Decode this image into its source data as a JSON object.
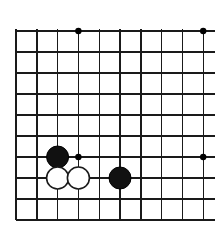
{
  "figure": {
    "board_kind": "go-board",
    "background_color": "#ffffff",
    "line_color": "#1a1a1a",
    "star_point_color": "#000000"
  },
  "board": {
    "columns": 10,
    "rows": 10,
    "origin_x": 16,
    "origin_y": 31,
    "spacing_x": 20.8,
    "spacing_y": 21.0,
    "edge_overhang_right": 12,
    "line_width_thin": 1.4,
    "line_width_edge": 2.2,
    "column_x": [
      16,
      36.8,
      57.6,
      78.4,
      99.2,
      120.0,
      140.8,
      161.6,
      182.4,
      203.2
    ],
    "row_y": [
      31,
      52,
      73,
      94,
      115,
      136,
      157,
      178,
      199,
      220
    ],
    "vertical_lines": [
      {
        "col": 0,
        "weight": "edge"
      },
      {
        "col": 1,
        "weight": "thin"
      },
      {
        "col": 2,
        "weight": "thin"
      },
      {
        "col": 3,
        "weight": "thin"
      },
      {
        "col": 4,
        "weight": "thin"
      },
      {
        "col": 5,
        "weight": "thin"
      },
      {
        "col": 6,
        "weight": "thin"
      },
      {
        "col": 7,
        "weight": "thin"
      },
      {
        "col": 8,
        "weight": "thin"
      },
      {
        "col": 9,
        "weight": "thin"
      }
    ],
    "horizontal_lines": [
      {
        "row": 0,
        "weight": "thin",
        "extends_right": true
      },
      {
        "row": 1,
        "weight": "thin",
        "extends_right": true
      },
      {
        "row": 2,
        "weight": "thin",
        "extends_right": true
      },
      {
        "row": 3,
        "weight": "thin",
        "extends_right": true
      },
      {
        "row": 4,
        "weight": "thin",
        "extends_right": true
      },
      {
        "row": 5,
        "weight": "thin",
        "extends_right": true
      },
      {
        "row": 6,
        "weight": "thin",
        "extends_right": true
      },
      {
        "row": 7,
        "weight": "thin",
        "extends_right": true
      },
      {
        "row": 8,
        "weight": "thin",
        "extends_right": true
      },
      {
        "row": 9,
        "weight": "edge",
        "extends_right": true
      }
    ]
  },
  "star_points": [
    {
      "label": "star-top-left",
      "col": 3,
      "row": 0,
      "radius": 3.2
    },
    {
      "label": "star-top-right",
      "col": 9,
      "row": 0,
      "radius": 3.2
    },
    {
      "label": "star-lower-left",
      "col": 3,
      "row": 6,
      "radius": 3.2
    },
    {
      "label": "star-lower-right",
      "col": 9,
      "row": 6,
      "radius": 3.2
    }
  ],
  "stones": [
    {
      "label": "black-stone-upper-left",
      "color": "black",
      "col": 2,
      "row": 6,
      "radius": 11.0
    },
    {
      "label": "white-stone-left",
      "color": "white",
      "col": 2,
      "row": 7,
      "radius": 11.0
    },
    {
      "label": "white-stone-right",
      "color": "white",
      "col": 3,
      "row": 7,
      "radius": 11.0
    },
    {
      "label": "black-stone-right",
      "color": "black",
      "col": 5,
      "row": 7,
      "radius": 11.0
    }
  ]
}
